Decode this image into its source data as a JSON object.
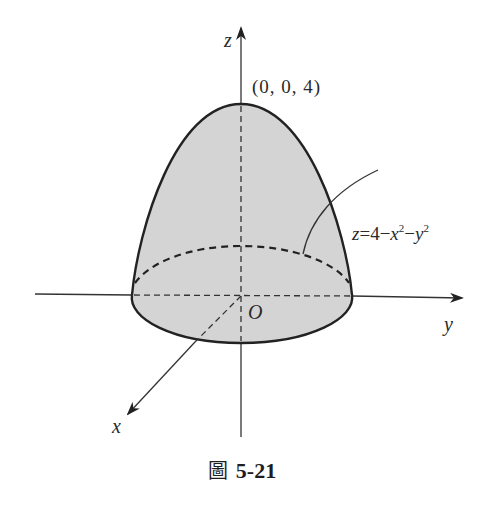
{
  "figure": {
    "caption_prefix": "圖",
    "caption_number": "5-21",
    "apex_label": "(0, 0, 4)",
    "equation": {
      "lhs": "z",
      "eq": "=",
      "const": "4",
      "minus1": "−",
      "var1": "x",
      "exp1": "2",
      "minus2": "−",
      "var2": "y",
      "exp2": "2"
    },
    "axes": {
      "x_label": "x",
      "y_label": "y",
      "z_label": "z",
      "origin_label": "O"
    },
    "colors": {
      "surface_fill": "#d4d4d4",
      "stroke": "#222222",
      "background": "#ffffff"
    }
  }
}
